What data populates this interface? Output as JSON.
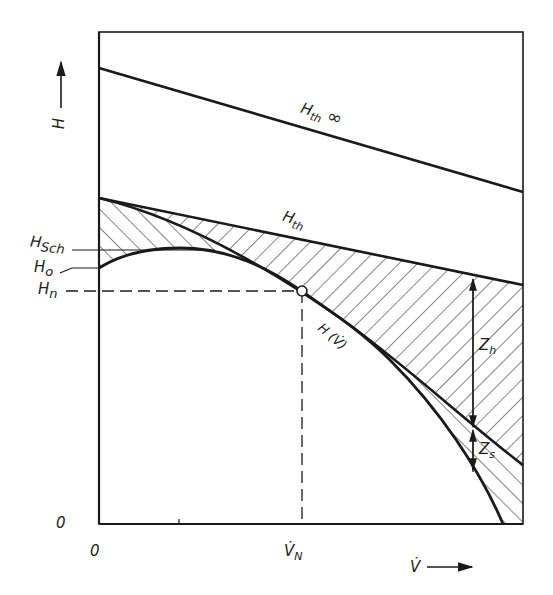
{
  "diagram": {
    "type": "pump head-flow characteristic",
    "y_axis": {
      "label": "H",
      "arrow": "up",
      "origin_label": "0"
    },
    "x_axis": {
      "label": "V̇",
      "arrow": "right",
      "origin_label": "0",
      "tick_label": "V̇N",
      "tick_main": "V̇",
      "tick_sub": "N"
    },
    "curves": [
      {
        "id": "h-th-inf",
        "label_main": "H",
        "label_sub": "th",
        "label_suffix": "∞",
        "kind": "straight line"
      },
      {
        "id": "h-th",
        "label_main": "H",
        "label_sub": "th",
        "kind": "straight line"
      },
      {
        "id": "h-v",
        "label": "H (V̇)",
        "kind": "curve"
      }
    ],
    "left_labels": [
      {
        "main": "H",
        "sub": "Sch"
      },
      {
        "main": "H",
        "sub": "o"
      },
      {
        "main": "H",
        "sub": "n"
      }
    ],
    "losses": [
      {
        "main": "Z",
        "sub": "h"
      },
      {
        "main": "Z",
        "sub": "s"
      }
    ],
    "operating_point": {
      "x_label": "V̇N",
      "y_label": "Hn"
    }
  },
  "colors": {
    "ink": "#1a1a1a",
    "background": "#ffffff"
  }
}
